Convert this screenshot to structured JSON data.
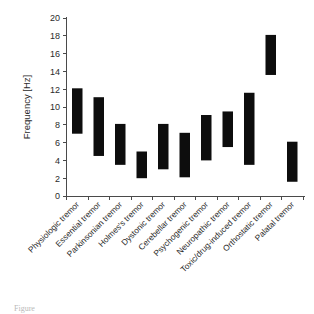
{
  "chart_data": {
    "type": "bar",
    "subtype": "floating-range-bar",
    "title": "",
    "xlabel": "",
    "ylabel": "Frequency [Hz]",
    "ylim": [
      0,
      20
    ],
    "ytick_step": 2,
    "yticks": [
      "20",
      "18",
      "16",
      "14",
      "12",
      "10",
      "8",
      "6",
      "4",
      "2",
      "0"
    ],
    "grid": false,
    "legend": null,
    "bar_color": "#0d0d0d",
    "axis_color": "#4a4a4a",
    "background": "#ffffff",
    "categories": [
      "Physiologic tremor",
      "Essential tremor",
      "Parkinsonian tremor",
      "Holmes's tremor",
      "Dystonic tremor",
      "Cerebellar tremor",
      "Psychogenic tremor",
      "Neuropathic tremor",
      "Toxic/drug-induced tremor",
      "Orthostatic tremor",
      "Palatal tremor"
    ],
    "ranges": [
      {
        "category": "Physiologic tremor",
        "low": 7.0,
        "high": 12.1
      },
      {
        "category": "Essential tremor",
        "low": 4.5,
        "high": 11.1
      },
      {
        "category": "Parkinsonian tremor",
        "low": 3.5,
        "high": 8.1
      },
      {
        "category": "Holmes's tremor",
        "low": 2.0,
        "high": 5.0
      },
      {
        "category": "Dystonic tremor",
        "low": 3.0,
        "high": 8.1
      },
      {
        "category": "Cerebellar tremor",
        "low": 2.1,
        "high": 7.1
      },
      {
        "category": "Psychogenic tremor",
        "low": 4.0,
        "high": 9.1
      },
      {
        "category": "Neuropathic tremor",
        "low": 5.5,
        "high": 9.5
      },
      {
        "category": "Toxic/drug-induced tremor",
        "low": 3.5,
        "high": 11.6
      },
      {
        "category": "Orthostatic tremor",
        "low": 13.6,
        "high": 18.1
      },
      {
        "category": "Palatal tremor",
        "low": 1.6,
        "high": 6.1
      }
    ]
  },
  "caption": {
    "text": "Figure"
  }
}
